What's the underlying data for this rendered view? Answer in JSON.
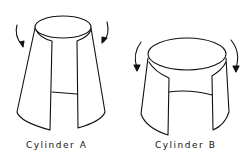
{
  "figures": [
    {
      "label": "Cylinder  A",
      "shape": "tall tapered cylinder with front slit",
      "arrows": "clockwise-inward"
    },
    {
      "label": "Cylinder  B",
      "shape": "short wide cylinder with front slit",
      "arrows": "outward-downward"
    }
  ],
  "colors": {
    "line": "#111111",
    "background": "#ffffff"
  }
}
